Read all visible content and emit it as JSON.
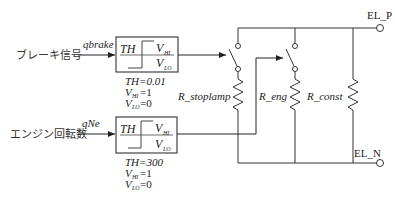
{
  "inputs": [
    {
      "label": "ブレーキ信号",
      "signal": "qbrake"
    },
    {
      "label": "エンジン回転数",
      "signal": "qNe"
    }
  ],
  "blocks": [
    {
      "th_label": "TH",
      "vhi_label": "V",
      "vhi_sub": "HI",
      "vlo_label": "V",
      "vlo_sub": "LO",
      "params": {
        "th": "TH=0.01",
        "vhi_v": "V",
        "vhi_sub": "HI",
        "vhi_val": "=1",
        "vlo_v": "V",
        "vlo_sub": "LO",
        "vlo_val": "=0"
      }
    },
    {
      "th_label": "TH",
      "vhi_label": "V",
      "vhi_sub": "HI",
      "vlo_label": "V",
      "vlo_sub": "LO",
      "params": {
        "th": "TH=300",
        "vhi_v": "V",
        "vhi_sub": "HI",
        "vhi_val": "=1",
        "vlo_v": "V",
        "vlo_sub": "LO",
        "vlo_val": "=0"
      }
    }
  ],
  "resistors": [
    {
      "label": "R_stoplamp"
    },
    {
      "label": "R_eng"
    },
    {
      "label": "R_const"
    }
  ],
  "terminals": {
    "positive": "EL_P",
    "negative": "EL_N"
  }
}
